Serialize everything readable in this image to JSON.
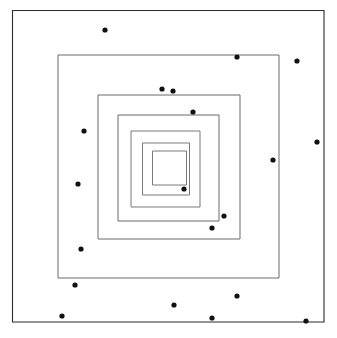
{
  "figure": {
    "title": "",
    "width": 337,
    "height": 338,
    "background_color": "#ffffff"
  },
  "chart_data": {
    "type": "scatter",
    "title": "",
    "subtitle": "",
    "xlabel": "",
    "ylabel": "",
    "xlim": [
      0,
      337
    ],
    "ylim": [
      0,
      338
    ],
    "grid": false,
    "legend": null,
    "axis_visible": false,
    "tick_labels_x": [],
    "tick_labels_y": [],
    "annotations": [],
    "series": [
      {
        "name": "concentric-squares",
        "type": "rectangle-outline",
        "stroke_color": "#555555",
        "outer_stroke_color": "#2b2b2b",
        "stroke_width": 0.9,
        "fill": "none",
        "count": 6,
        "rectangles": [
          {
            "index": 1,
            "x": 12.5,
            "y": 10.5,
            "width": 311.5,
            "height": 311.5,
            "stroke_color": "#2b2b2b",
            "stroke_width": 1.1
          },
          {
            "index": 2,
            "x": 58.0,
            "y": 55.0,
            "width": 221.0,
            "height": 223.0,
            "stroke_color": "#5a5a5a",
            "stroke_width": 0.9
          },
          {
            "index": 3,
            "x": 98.0,
            "y": 95.0,
            "width": 142.0,
            "height": 144.0,
            "stroke_color": "#5a5a5a",
            "stroke_width": 0.9
          },
          {
            "index": 4,
            "x": 118.0,
            "y": 115.0,
            "width": 101.0,
            "height": 106.0,
            "stroke_color": "#5a5a5a",
            "stroke_width": 0.9
          },
          {
            "index": 5,
            "x": 131.0,
            "y": 131.0,
            "width": 69.0,
            "height": 76.0,
            "stroke_color": "#6a6a6a",
            "stroke_width": 0.9
          },
          {
            "index": 6,
            "x": 142.5,
            "y": 143.0,
            "width": 47.0,
            "height": 52.0,
            "stroke_color": "#6a6a6a",
            "stroke_width": 0.9
          },
          {
            "index": 7,
            "x": 152.5,
            "y": 151.0,
            "width": 34.0,
            "height": 34.0,
            "stroke_color": "#6a6a6a",
            "stroke_width": 0.9
          }
        ]
      },
      {
        "name": "scatter-points",
        "type": "scatter",
        "marker": "circle",
        "marker_color": "#111111",
        "marker_radius": 2.6,
        "count": 22,
        "points": [
          {
            "id": 1,
            "x": 105,
            "y": 30
          },
          {
            "id": 2,
            "x": 237,
            "y": 57
          },
          {
            "id": 3,
            "x": 297,
            "y": 61
          },
          {
            "id": 4,
            "x": 162,
            "y": 89
          },
          {
            "id": 5,
            "x": 173,
            "y": 91
          },
          {
            "id": 6,
            "x": 193,
            "y": 112
          },
          {
            "id": 7,
            "x": 84,
            "y": 131
          },
          {
            "id": 8,
            "x": 317,
            "y": 142
          },
          {
            "id": 9,
            "x": 273,
            "y": 160
          },
          {
            "id": 10,
            "x": 78,
            "y": 184
          },
          {
            "id": 11,
            "x": 184,
            "y": 189
          },
          {
            "id": 12,
            "x": 224,
            "y": 216
          },
          {
            "id": 13,
            "x": 212,
            "y": 228
          },
          {
            "id": 14,
            "x": 81,
            "y": 249
          },
          {
            "id": 15,
            "x": 75,
            "y": 285
          },
          {
            "id": 16,
            "x": 237,
            "y": 296
          },
          {
            "id": 17,
            "x": 174,
            "y": 305
          },
          {
            "id": 18,
            "x": 62,
            "y": 316
          },
          {
            "id": 19,
            "x": 212,
            "y": 318
          },
          {
            "id": 20,
            "x": 306,
            "y": 321
          }
        ]
      }
    ]
  }
}
